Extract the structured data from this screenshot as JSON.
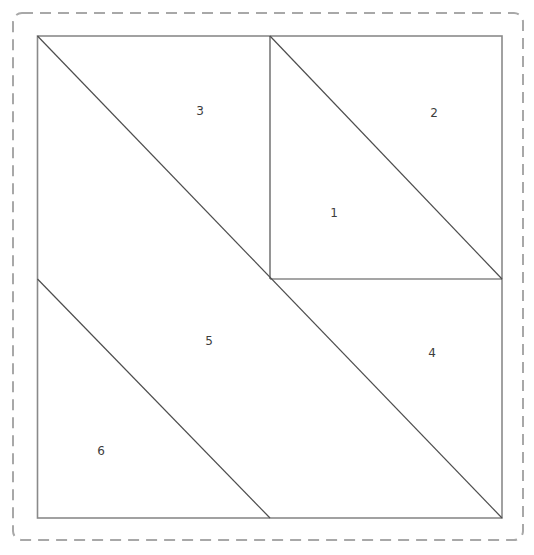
{
  "diagram": {
    "type": "quilt-block-piecing-pattern",
    "canvas": {
      "width": 534,
      "height": 555,
      "background": "#ffffff"
    },
    "outer_dashed_border": {
      "x": 13,
      "y": 13,
      "width": 510,
      "height": 527,
      "corner_radius": 9,
      "color": "#a8a8a8",
      "stroke_width": 2,
      "dash_pattern": "11 7"
    },
    "block_outline": {
      "x": 37.5,
      "y": 36,
      "width": 464.5,
      "height": 482,
      "color": "#8a8a8a",
      "stroke_width": 1.6
    },
    "seam_line_style": {
      "color": "#4d4d4d",
      "stroke_width": 1.2
    },
    "seam_lines": [
      {
        "name": "vertical-divider",
        "x1": 270,
        "y1": 36,
        "x2": 270,
        "y2": 279
      },
      {
        "name": "horizontal-divider",
        "x1": 270,
        "y1": 279,
        "x2": 502,
        "y2": 279
      },
      {
        "name": "main-diagonal",
        "x1": 37.5,
        "y1": 36,
        "x2": 502,
        "y2": 518
      },
      {
        "name": "upper-right-diagonal",
        "x1": 270,
        "y1": 36,
        "x2": 502,
        "y2": 279
      },
      {
        "name": "lower-left-diagonal",
        "x1": 37.5,
        "y1": 279,
        "x2": 270,
        "y2": 518
      }
    ],
    "label_style": {
      "color": "#3d3d3d",
      "font_size": 12
    },
    "piece_labels": [
      {
        "text": "1",
        "x": 334,
        "y": 213
      },
      {
        "text": "2",
        "x": 434,
        "y": 113
      },
      {
        "text": "3",
        "x": 200,
        "y": 111
      },
      {
        "text": "4",
        "x": 432,
        "y": 353
      },
      {
        "text": "5",
        "x": 209,
        "y": 341
      },
      {
        "text": "6",
        "x": 101,
        "y": 451
      }
    ]
  }
}
